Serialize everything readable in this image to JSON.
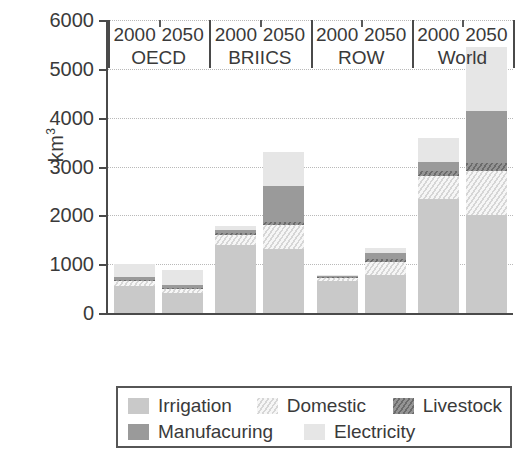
{
  "chart_data": {
    "type": "bar",
    "subtype": "stacked",
    "title": "",
    "xlabel": "",
    "ylabel": "km3",
    "ylabel_display": "km",
    "ylabel_superscript": "3",
    "ylim": [
      0,
      6000
    ],
    "yticks": [
      0,
      1000,
      2000,
      3000,
      4000,
      5000,
      6000
    ],
    "ytick_labels": [
      "0",
      "1000",
      "2000",
      "3000",
      "4000",
      "5000",
      "6000"
    ],
    "grid": "horizontal-dotted",
    "legend_position": "below-plot",
    "groups": [
      "OECD",
      "BRIICS",
      "ROW",
      "World"
    ],
    "years": [
      "2000",
      "2050"
    ],
    "categories": [
      "OECD 2000",
      "OECD 2050",
      "BRIICS 2000",
      "BRIICS 2050",
      "ROW 2000",
      "ROW 2050",
      "World 2000",
      "World 2050"
    ],
    "series": [
      {
        "name": "Irrigation",
        "color": "#c9c9c9",
        "pattern": "solid",
        "values": [
          550,
          400,
          1400,
          1320,
          650,
          770,
          2340,
          2000
        ]
      },
      {
        "name": "Domestic",
        "color": "#ededed",
        "pattern": "diagonal-hatch-light",
        "values": [
          100,
          90,
          190,
          480,
          70,
          280,
          460,
          900
        ]
      },
      {
        "name": "Livestock",
        "color": "#7d7d7d",
        "pattern": "diagonal-hatch-dark",
        "values": [
          30,
          30,
          50,
          70,
          20,
          50,
          110,
          170
        ]
      },
      {
        "name": "Manufacuring",
        "color": "#9a9a9a",
        "pattern": "solid",
        "values": [
          60,
          50,
          60,
          740,
          10,
          120,
          190,
          1060
        ]
      },
      {
        "name": "Electricity",
        "color": "#e6e6e6",
        "pattern": "solid",
        "values": [
          260,
          320,
          90,
          690,
          20,
          110,
          490,
          1320
        ]
      }
    ],
    "totals": [
      1000,
      890,
      1790,
      3300,
      770,
      1330,
      3590,
      5450
    ]
  },
  "axis": {
    "y_ticks": [
      {
        "label": "6000",
        "value": 6000
      },
      {
        "label": "5000",
        "value": 5000
      },
      {
        "label": "4000",
        "value": 4000
      },
      {
        "label": "3000",
        "value": 3000
      },
      {
        "label": "2000",
        "value": 2000
      },
      {
        "label": "1000",
        "value": 1000
      },
      {
        "label": "0",
        "value": 0
      }
    ],
    "y_title_main": "km",
    "y_title_sup": "3",
    "x_groups": [
      {
        "name": "OECD",
        "years": [
          "2000",
          "2050"
        ]
      },
      {
        "name": "BRIICS",
        "years": [
          "2000",
          "2050"
        ]
      },
      {
        "name": "ROW",
        "years": [
          "2000",
          "2050"
        ]
      },
      {
        "name": "World",
        "years": [
          "2000",
          "2050"
        ]
      }
    ]
  },
  "legend": {
    "row1": [
      {
        "label": "Irrigation",
        "swatch": "irrigation"
      },
      {
        "label": "Domestic",
        "swatch": "domestic"
      },
      {
        "label": "Livestock",
        "swatch": "livestock"
      }
    ],
    "row2": [
      {
        "label": "Manufacuring",
        "swatch": "manufacturing"
      },
      {
        "label": "Electricity",
        "swatch": "electricity"
      }
    ]
  }
}
